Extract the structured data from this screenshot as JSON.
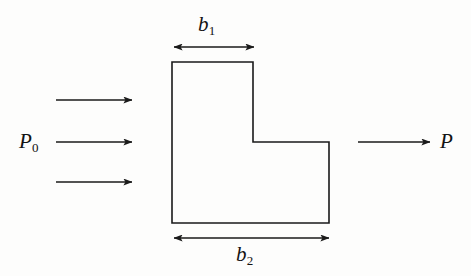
{
  "figure": {
    "kind": "engineering-diagram",
    "background_color": "#fdfdfc",
    "line_color": "#1a1a1a",
    "body": {
      "name": "l-shaped-body",
      "outline_points": "172,62 253,62 253,142 329,142 329,223 172,223",
      "fill": "none"
    },
    "dimensions": [
      {
        "id": "b1",
        "label": "b",
        "subscript": "1",
        "measures": "width of the upper tall section",
        "x_start": 173,
        "x_end": 255,
        "y": 47,
        "label_position": "above"
      },
      {
        "id": "b2",
        "label": "b",
        "subscript": "2",
        "measures": "total width of the base",
        "x_start": 173,
        "x_end": 330,
        "y": 238,
        "label_position": "below"
      }
    ],
    "inflow": {
      "id": "inflow-arrows",
      "label": "P",
      "subscript": "0",
      "count": 3,
      "arrows": [
        {
          "x_start": 56,
          "x_end": 133,
          "y": 100
        },
        {
          "x_start": 56,
          "x_end": 133,
          "y": 142
        },
        {
          "x_start": 56,
          "x_end": 133,
          "y": 182
        }
      ]
    },
    "outflow": {
      "id": "outflow-arrow",
      "label": "P",
      "subscript": "",
      "count": 1,
      "arrows": [
        {
          "x_start": 358,
          "x_end": 431,
          "y": 142
        }
      ]
    }
  },
  "labels": {
    "b1_base": "b",
    "b1_sub": "1",
    "b2_base": "b",
    "b2_sub": "2",
    "p0_base": "P",
    "p0_sub": "0",
    "p_base": "P"
  }
}
